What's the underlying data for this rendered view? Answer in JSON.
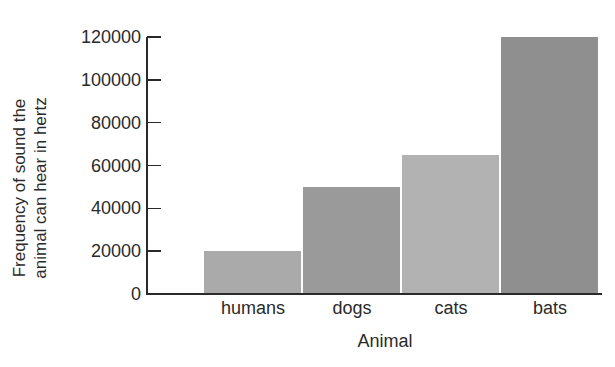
{
  "chart_data": {
    "type": "bar",
    "title": "",
    "xlabel": "Animal",
    "ylabel": "Frequency of sound the animal can hear in hertz",
    "ylabel_lines": [
      "Frequency of sound the",
      "animal can hear in hertz"
    ],
    "categories": [
      "humans",
      "dogs",
      "cats",
      "bats"
    ],
    "values": [
      20000,
      50000,
      65000,
      120000
    ],
    "colors": [
      "#aaaaaa",
      "#9a9a9a",
      "#b2b2b2",
      "#8f8f8f"
    ],
    "ylim": [
      0,
      120000
    ],
    "yticks": [
      0,
      20000,
      40000,
      60000,
      80000,
      100000,
      120000
    ],
    "ytick_labels": [
      "0",
      "20000",
      "40000",
      "60000",
      "80000",
      "100000",
      "120000"
    ],
    "grid": false,
    "legend": null
  }
}
